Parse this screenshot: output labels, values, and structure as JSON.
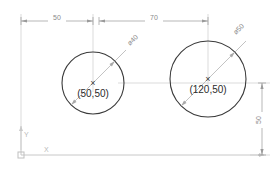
{
  "drawing": {
    "title": "Two Circles with Coordinate Dimensions",
    "background_color": "#ffffff",
    "geometry_color": "#3a3a3a",
    "dimension_color": "#9a9a9a",
    "axis_color": "#c8c8c8",
    "leader_color": "#a8a8a8",
    "text_color": "#2b2b2b"
  },
  "circles": [
    {
      "id": "circle-left",
      "center_label": "(50,50)",
      "diameter_label": "ø40",
      "center_x": 50,
      "center_y": 50,
      "diameter": 40
    },
    {
      "id": "circle-right",
      "center_label": "(120,50)",
      "diameter_label": "ø50",
      "center_x": 120,
      "center_y": 50,
      "diameter": 50
    }
  ],
  "dimensions": [
    {
      "id": "dim-horizontal-50",
      "label": "50",
      "orientation": "horizontal",
      "value": 50
    },
    {
      "id": "dim-horizontal-70",
      "label": "70",
      "orientation": "horizontal",
      "value": 70
    },
    {
      "id": "dim-vertical-50",
      "label": "50",
      "orientation": "vertical",
      "value": 50
    }
  ],
  "axes": {
    "x_label": "X",
    "y_label": "Y",
    "origin_marker": "origin-square"
  },
  "center_marks": {
    "glyph": "×"
  }
}
